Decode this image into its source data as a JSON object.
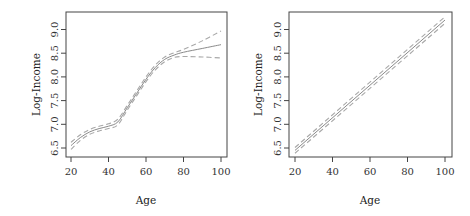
{
  "chart_data": [
    {
      "type": "line",
      "title": "",
      "xlabel": "Age",
      "ylabel": "Log-Income",
      "xlim": [
        17,
        103
      ],
      "ylim": [
        6.3,
        9.35
      ],
      "xticks": [
        20,
        40,
        60,
        80,
        100
      ],
      "yticks": [
        6.5,
        7.0,
        7.5,
        8.0,
        8.5,
        9.0
      ],
      "ytick_labels": [
        "6.5",
        "7.0",
        "7.5",
        "8.0",
        "8.5",
        "9.0"
      ],
      "xtick_labels": [
        "20",
        "40",
        "60",
        "80",
        "100"
      ],
      "grid": false,
      "legend": null,
      "x": [
        20,
        25,
        30,
        35,
        40,
        45,
        50,
        55,
        60,
        65,
        70,
        75,
        80,
        90,
        100
      ],
      "series": [
        {
          "name": "fit",
          "style": "solid",
          "values": [
            6.55,
            6.72,
            6.84,
            6.91,
            6.96,
            7.05,
            7.35,
            7.65,
            7.95,
            8.2,
            8.37,
            8.46,
            8.52,
            8.6,
            8.68
          ]
        },
        {
          "name": "upper",
          "style": "dashed",
          "values": [
            6.62,
            6.78,
            6.89,
            6.96,
            7.01,
            7.11,
            7.4,
            7.7,
            8.0,
            8.25,
            8.42,
            8.51,
            8.58,
            8.76,
            8.97
          ]
        },
        {
          "name": "lower",
          "style": "dashed",
          "values": [
            6.47,
            6.66,
            6.79,
            6.86,
            6.91,
            6.99,
            7.3,
            7.6,
            7.9,
            8.15,
            8.32,
            8.41,
            8.43,
            8.42,
            8.4
          ]
        }
      ]
    },
    {
      "type": "line",
      "title": "",
      "xlabel": "Age",
      "ylabel": "Log-Income",
      "xlim": [
        17,
        103
      ],
      "ylim": [
        6.3,
        9.35
      ],
      "xticks": [
        20,
        40,
        60,
        80,
        100
      ],
      "yticks": [
        6.5,
        7.0,
        7.5,
        8.0,
        8.5,
        9.0
      ],
      "ytick_labels": [
        "6.5",
        "7.0",
        "7.5",
        "8.0",
        "8.5",
        "9.0"
      ],
      "xtick_labels": [
        "20",
        "40",
        "60",
        "80",
        "100"
      ],
      "grid": false,
      "legend": null,
      "x": [
        20,
        100
      ],
      "series": [
        {
          "name": "fit",
          "style": "solid",
          "values": [
            6.45,
            9.2
          ]
        },
        {
          "name": "upper",
          "style": "dashed",
          "values": [
            6.51,
            9.27
          ]
        },
        {
          "name": "lower",
          "style": "dashed",
          "values": [
            6.39,
            9.13
          ]
        }
      ]
    }
  ]
}
